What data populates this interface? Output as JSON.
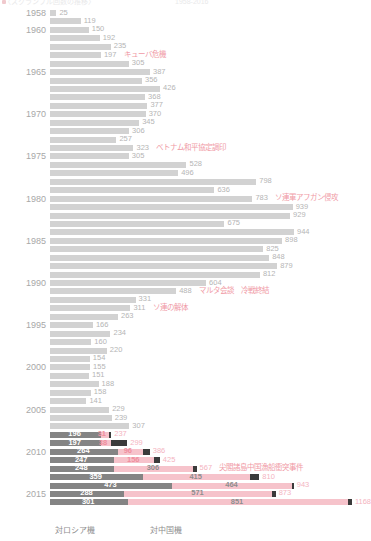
{
  "header": {
    "left_text": "〈スクランブル回数の推移〉",
    "right_text": "1958-2016"
  },
  "legend": {
    "russia_label": "対ロシア機",
    "china_label": "対中国機"
  },
  "colors": {
    "russia_light": "#d2d2d2",
    "russia_dark": "#848484",
    "china": "#f6c3cb",
    "other": "#3b3b3b",
    "annotation": "#f09aa6",
    "axis_label": "#a8a8a8"
  },
  "chart_data": {
    "type": "bar",
    "orientation": "horizontal",
    "title": "〈スクランブル回数の推移〉",
    "xlabel": "",
    "ylabel": "",
    "xlim": [
      0,
      1180
    ],
    "grid": false,
    "legend_position": "bottom",
    "categories": [
      "1958",
      "1959",
      "1960",
      "1961",
      "1962",
      "1963",
      "1964",
      "1965",
      "1966",
      "1967",
      "1968",
      "1969",
      "1970",
      "1971",
      "1972",
      "1973",
      "1974",
      "1975",
      "1976",
      "1977",
      "1978",
      "1979",
      "1980",
      "1981",
      "1982",
      "1983",
      "1984",
      "1985",
      "1986",
      "1987",
      "1988",
      "1989",
      "1990",
      "1991",
      "1992",
      "1993",
      "1994",
      "1995",
      "1996",
      "1997",
      "1998",
      "1999",
      "2000",
      "2001",
      "2002",
      "2003",
      "2004",
      "2005",
      "2006",
      "2007",
      "2008",
      "2009",
      "2010",
      "2011",
      "2012",
      "2013",
      "2014",
      "2015",
      "2016"
    ],
    "series": [
      {
        "name": "対ロシア機",
        "color": "#d2d2d2",
        "values": [
          25,
          119,
          150,
          192,
          235,
          197,
          305,
          387,
          356,
          426,
          368,
          377,
          370,
          345,
          306,
          257,
          323,
          305,
          528,
          496,
          798,
          636,
          783,
          939,
          929,
          675,
          944,
          898,
          825,
          848,
          879,
          812,
          604,
          488,
          331,
          311,
          263,
          166,
          234,
          160,
          220,
          154,
          155,
          151,
          188,
          158,
          141,
          229,
          239,
          307,
          196,
          197,
          264,
          247,
          248,
          359,
          473,
          288,
          301
        ]
      },
      {
        "name": "対中国機",
        "color": "#f6c3cb",
        "values": [
          0,
          0,
          0,
          0,
          0,
          0,
          0,
          0,
          0,
          0,
          0,
          0,
          0,
          0,
          0,
          0,
          0,
          0,
          0,
          0,
          0,
          0,
          0,
          0,
          0,
          0,
          0,
          0,
          0,
          0,
          0,
          0,
          0,
          0,
          0,
          0,
          0,
          0,
          0,
          0,
          0,
          0,
          0,
          0,
          0,
          0,
          0,
          0,
          0,
          0,
          31,
          38,
          96,
          156,
          306,
          415,
          464,
          571,
          851
        ]
      },
      {
        "name": "その他",
        "color": "#3b3b3b",
        "values": [
          0,
          0,
          0,
          0,
          0,
          0,
          0,
          0,
          0,
          0,
          0,
          0,
          0,
          0,
          0,
          0,
          0,
          0,
          0,
          0,
          0,
          0,
          0,
          0,
          0,
          0,
          0,
          0,
          0,
          0,
          0,
          0,
          0,
          0,
          0,
          0,
          0,
          0,
          0,
          0,
          0,
          0,
          0,
          0,
          0,
          0,
          0,
          0,
          0,
          0,
          10,
          64,
          26,
          22,
          13,
          36,
          6,
          14,
          16
        ]
      }
    ],
    "totals": [
      25,
      119,
      150,
      192,
      235,
      197,
      305,
      387,
      356,
      426,
      368,
      377,
      370,
      345,
      306,
      257,
      323,
      305,
      528,
      496,
      798,
      636,
      783,
      939,
      929,
      675,
      944,
      898,
      825,
      848,
      879,
      812,
      604,
      488,
      331,
      311,
      263,
      166,
      234,
      160,
      220,
      154,
      155,
      151,
      188,
      158,
      141,
      229,
      239,
      307,
      237,
      299,
      386,
      425,
      567,
      810,
      943,
      873,
      1168
    ],
    "axis_tick_labels": [
      "1958",
      "1960",
      "1965",
      "1970",
      "1975",
      "1980",
      "1985",
      "1990",
      "1995",
      "2000",
      "2005",
      "2010",
      "2015",
      "2016"
    ],
    "annotations": [
      {
        "year": "1963",
        "text": "キューバ危機"
      },
      {
        "year": "1974",
        "text": "ベトナム和平協定調印"
      },
      {
        "year": "1980",
        "text": "ソ連軍アフガン侵攻"
      },
      {
        "year": "1991",
        "text": "マルタ会談　冷戦終結"
      },
      {
        "year": "1993",
        "text": "ソ連の解体"
      },
      {
        "year": "2012",
        "text": "尖閣諸島中国漁船衝突事件"
      }
    ]
  },
  "rows": [
    {
      "year": "1958",
      "show_year": true,
      "ru": 25,
      "cn": 0,
      "ot": 0,
      "total": 25,
      "label": "25",
      "note": ""
    },
    {
      "year": "1959",
      "show_year": false,
      "ru": 119,
      "cn": 0,
      "ot": 0,
      "total": 119,
      "label": "119",
      "note": ""
    },
    {
      "year": "1960",
      "show_year": true,
      "ru": 150,
      "cn": 0,
      "ot": 0,
      "total": 150,
      "label": "150",
      "note": ""
    },
    {
      "year": "1961",
      "show_year": false,
      "ru": 192,
      "cn": 0,
      "ot": 0,
      "total": 192,
      "label": "192",
      "note": ""
    },
    {
      "year": "1962",
      "show_year": false,
      "ru": 235,
      "cn": 0,
      "ot": 0,
      "total": 235,
      "label": "235",
      "note": ""
    },
    {
      "year": "1963",
      "show_year": false,
      "ru": 197,
      "cn": 0,
      "ot": 0,
      "total": 197,
      "label": "197",
      "note": "キューバ危機"
    },
    {
      "year": "1964",
      "show_year": false,
      "ru": 305,
      "cn": 0,
      "ot": 0,
      "total": 305,
      "label": "305",
      "note": ""
    },
    {
      "year": "1965",
      "show_year": true,
      "ru": 387,
      "cn": 0,
      "ot": 0,
      "total": 387,
      "label": "387",
      "note": ""
    },
    {
      "year": "1966",
      "show_year": false,
      "ru": 356,
      "cn": 0,
      "ot": 0,
      "total": 356,
      "label": "356",
      "note": ""
    },
    {
      "year": "1967",
      "show_year": false,
      "ru": 426,
      "cn": 0,
      "ot": 0,
      "total": 426,
      "label": "426",
      "note": ""
    },
    {
      "year": "1968",
      "show_year": false,
      "ru": 368,
      "cn": 0,
      "ot": 0,
      "total": 368,
      "label": "368",
      "note": ""
    },
    {
      "year": "1969",
      "show_year": false,
      "ru": 377,
      "cn": 0,
      "ot": 0,
      "total": 377,
      "label": "377",
      "note": ""
    },
    {
      "year": "1970",
      "show_year": true,
      "ru": 370,
      "cn": 0,
      "ot": 0,
      "total": 370,
      "label": "370",
      "note": ""
    },
    {
      "year": "1971",
      "show_year": false,
      "ru": 345,
      "cn": 0,
      "ot": 0,
      "total": 345,
      "label": "345",
      "note": ""
    },
    {
      "year": "1972",
      "show_year": false,
      "ru": 306,
      "cn": 0,
      "ot": 0,
      "total": 306,
      "label": "306",
      "note": ""
    },
    {
      "year": "1973",
      "show_year": false,
      "ru": 257,
      "cn": 0,
      "ot": 0,
      "total": 257,
      "label": "257",
      "note": ""
    },
    {
      "year": "1974",
      "show_year": false,
      "ru": 323,
      "cn": 0,
      "ot": 0,
      "total": 323,
      "label": "323",
      "note": "ベトナム和平協定調印"
    },
    {
      "year": "1975",
      "show_year": true,
      "ru": 305,
      "cn": 0,
      "ot": 0,
      "total": 305,
      "label": "305",
      "note": ""
    },
    {
      "year": "1976",
      "show_year": false,
      "ru": 528,
      "cn": 0,
      "ot": 0,
      "total": 528,
      "label": "528",
      "note": ""
    },
    {
      "year": "1977",
      "show_year": false,
      "ru": 496,
      "cn": 0,
      "ot": 0,
      "total": 496,
      "label": "496",
      "note": ""
    },
    {
      "year": "1978",
      "show_year": false,
      "ru": 798,
      "cn": 0,
      "ot": 0,
      "total": 798,
      "label": "798",
      "note": ""
    },
    {
      "year": "1979",
      "show_year": false,
      "ru": 636,
      "cn": 0,
      "ot": 0,
      "total": 636,
      "label": "636",
      "note": ""
    },
    {
      "year": "1980",
      "show_year": true,
      "ru": 783,
      "cn": 0,
      "ot": 0,
      "total": 783,
      "label": "783",
      "note": "ソ連軍アフガン侵攻"
    },
    {
      "year": "1981",
      "show_year": false,
      "ru": 939,
      "cn": 0,
      "ot": 0,
      "total": 939,
      "label": "939",
      "note": ""
    },
    {
      "year": "1982",
      "show_year": false,
      "ru": 929,
      "cn": 0,
      "ot": 0,
      "total": 929,
      "label": "929",
      "note": ""
    },
    {
      "year": "1983",
      "show_year": false,
      "ru": 675,
      "cn": 0,
      "ot": 0,
      "total": 675,
      "label": "675",
      "note": ""
    },
    {
      "year": "1984",
      "show_year": false,
      "ru": 944,
      "cn": 0,
      "ot": 0,
      "total": 944,
      "label": "944",
      "note": ""
    },
    {
      "year": "1985",
      "show_year": true,
      "ru": 898,
      "cn": 0,
      "ot": 0,
      "total": 898,
      "label": "898",
      "note": ""
    },
    {
      "year": "1986",
      "show_year": false,
      "ru": 825,
      "cn": 0,
      "ot": 0,
      "total": 825,
      "label": "825",
      "note": ""
    },
    {
      "year": "1987",
      "show_year": false,
      "ru": 848,
      "cn": 0,
      "ot": 0,
      "total": 848,
      "label": "848",
      "note": ""
    },
    {
      "year": "1988",
      "show_year": false,
      "ru": 879,
      "cn": 0,
      "ot": 0,
      "total": 879,
      "label": "879",
      "note": ""
    },
    {
      "year": "1989",
      "show_year": false,
      "ru": 812,
      "cn": 0,
      "ot": 0,
      "total": 812,
      "label": "812",
      "note": ""
    },
    {
      "year": "1990",
      "show_year": true,
      "ru": 604,
      "cn": 0,
      "ot": 0,
      "total": 604,
      "label": "604",
      "note": ""
    },
    {
      "year": "1991",
      "show_year": false,
      "ru": 488,
      "cn": 0,
      "ot": 0,
      "total": 488,
      "label": "488",
      "note": "マルタ会談　冷戦終結"
    },
    {
      "year": "1992",
      "show_year": false,
      "ru": 331,
      "cn": 0,
      "ot": 0,
      "total": 331,
      "label": "331",
      "note": ""
    },
    {
      "year": "1993",
      "show_year": false,
      "ru": 311,
      "cn": 0,
      "ot": 0,
      "total": 311,
      "label": "311",
      "note": "ソ連の解体"
    },
    {
      "year": "1994",
      "show_year": false,
      "ru": 263,
      "cn": 0,
      "ot": 0,
      "total": 263,
      "label": "263",
      "note": ""
    },
    {
      "year": "1995",
      "show_year": true,
      "ru": 166,
      "cn": 0,
      "ot": 0,
      "total": 166,
      "label": "166",
      "note": ""
    },
    {
      "year": "1996",
      "show_year": false,
      "ru": 234,
      "cn": 0,
      "ot": 0,
      "total": 234,
      "label": "234",
      "note": ""
    },
    {
      "year": "1997",
      "show_year": false,
      "ru": 160,
      "cn": 0,
      "ot": 0,
      "total": 160,
      "label": "160",
      "note": ""
    },
    {
      "year": "1998",
      "show_year": false,
      "ru": 220,
      "cn": 0,
      "ot": 0,
      "total": 220,
      "label": "220",
      "note": ""
    },
    {
      "year": "1999",
      "show_year": false,
      "ru": 154,
      "cn": 0,
      "ot": 0,
      "total": 154,
      "label": "154",
      "note": ""
    },
    {
      "year": "2000",
      "show_year": true,
      "ru": 155,
      "cn": 0,
      "ot": 0,
      "total": 155,
      "label": "155",
      "note": ""
    },
    {
      "year": "2001",
      "show_year": false,
      "ru": 151,
      "cn": 0,
      "ot": 0,
      "total": 151,
      "label": "151",
      "note": ""
    },
    {
      "year": "2002",
      "show_year": false,
      "ru": 188,
      "cn": 0,
      "ot": 0,
      "total": 188,
      "label": "188",
      "note": ""
    },
    {
      "year": "2003",
      "show_year": false,
      "ru": 158,
      "cn": 0,
      "ot": 0,
      "total": 158,
      "label": "158",
      "note": ""
    },
    {
      "year": "2004",
      "show_year": false,
      "ru": 141,
      "cn": 0,
      "ot": 0,
      "total": 141,
      "label": "141",
      "note": ""
    },
    {
      "year": "2005",
      "show_year": true,
      "ru": 229,
      "cn": 0,
      "ot": 0,
      "total": 229,
      "label": "229",
      "note": ""
    },
    {
      "year": "2006",
      "show_year": false,
      "ru": 239,
      "cn": 0,
      "ot": 0,
      "total": 239,
      "label": "239",
      "note": ""
    },
    {
      "year": "2007",
      "show_year": false,
      "ru": 307,
      "cn": 0,
      "ot": 0,
      "total": 307,
      "label": "307",
      "note": ""
    },
    {
      "year": "2008",
      "show_year": false,
      "ru": 196,
      "cn": 31,
      "ot": 10,
      "total": 237,
      "label": "237",
      "ru_label": "196",
      "cn_label": "31",
      "note": ""
    },
    {
      "year": "2009",
      "show_year": false,
      "ru": 197,
      "cn": 38,
      "ot": 64,
      "total": 299,
      "label": "299",
      "ru_label": "197",
      "cn_label": "38",
      "note": ""
    },
    {
      "year": "2010",
      "show_year": true,
      "ru": 264,
      "cn": 96,
      "ot": 26,
      "total": 386,
      "label": "386",
      "ru_label": "264",
      "cn_label": "96",
      "note": ""
    },
    {
      "year": "2011",
      "show_year": false,
      "ru": 247,
      "cn": 156,
      "ot": 22,
      "total": 425,
      "label": "425",
      "ru_label": "247",
      "cn_label": "156",
      "note": ""
    },
    {
      "year": "2012",
      "show_year": false,
      "ru": 248,
      "cn": 306,
      "ot": 13,
      "total": 567,
      "label": "567",
      "ru_label": "248",
      "cn_label": "306",
      "note": "尖閣諸島中国漁船衝突事件"
    },
    {
      "year": "2013",
      "show_year": false,
      "ru": 359,
      "cn": 415,
      "ot": 36,
      "total": 810,
      "label": "810",
      "ru_label": "359",
      "cn_label": "415",
      "note": ""
    },
    {
      "year": "2014",
      "show_year": false,
      "ru": 473,
      "cn": 464,
      "ot": 6,
      "total": 943,
      "label": "943",
      "ru_label": "473",
      "cn_label": "464",
      "note": ""
    },
    {
      "year": "2015",
      "show_year": true,
      "ru": 288,
      "cn": 571,
      "ot": 14,
      "total": 873,
      "label": "873",
      "ru_label": "288",
      "cn_label": "571",
      "note": ""
    },
    {
      "year": "2016",
      "show_year": false,
      "ru": 301,
      "cn": 851,
      "ot": 16,
      "total": 1168,
      "label": "1168",
      "ru_label": "301",
      "cn_label": "851",
      "note": ""
    }
  ]
}
